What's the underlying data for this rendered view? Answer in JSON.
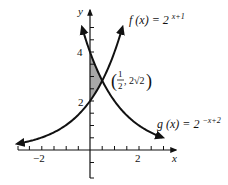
{
  "diagram": {
    "type": "function-graph",
    "axes": {
      "x_label": "x",
      "y_label": "y",
      "x_tick_labels": [
        "-2",
        "2"
      ],
      "y_tick_labels": [
        "2",
        "4"
      ],
      "tick_step": 0.5,
      "x_range": [
        -3,
        3.5
      ],
      "y_range": [
        -2,
        6
      ]
    },
    "curves": [
      {
        "name": "f",
        "label_lhs": "f (x) = 2",
        "label_exp": "x+1",
        "expression": "2^(x+1)",
        "color": "#111111"
      },
      {
        "name": "g",
        "label_lhs": "g (x) = 2",
        "label_exp": "−x+2",
        "expression": "2^(-x+2)",
        "color": "#111111"
      }
    ],
    "intersection": {
      "label_x_num": "1",
      "label_x_den": "2",
      "label_y": "2√2",
      "x": 0.5,
      "y": 2.828
    },
    "shaded_region": {
      "x_from": 0,
      "x_to": 0.5,
      "between": [
        "f",
        "g"
      ],
      "color": "#a8a8a8"
    }
  },
  "labels": {
    "y_axis": "y",
    "x_axis": "x",
    "y_tick_4": "4",
    "y_tick_2": "2",
    "x_tick_neg2": "−2",
    "x_tick_2": "2",
    "f_lhs": "f (x) = 2",
    "f_exp": "x+1",
    "g_lhs": "g (x) = 2",
    "g_exp": "−x+2",
    "pt_num": "1",
    "pt_den": "2",
    "pt_y": ", 2√2"
  }
}
